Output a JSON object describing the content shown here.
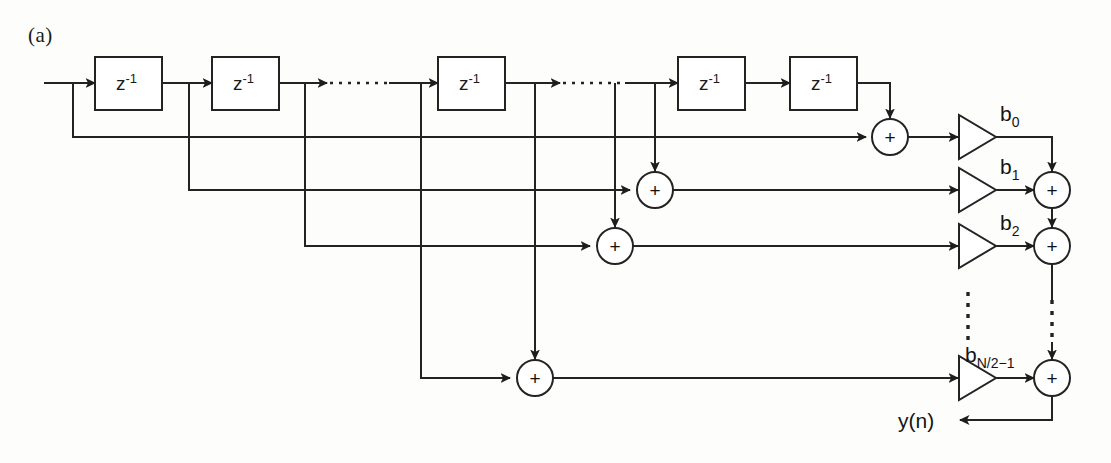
{
  "figure": {
    "panel_label": "(a)",
    "type": "signal-flow-diagram"
  },
  "delays": {
    "label": "z",
    "exponent": "-1",
    "count_shown": 5,
    "items": [
      {
        "id": "z1",
        "label": "z",
        "exponent": "-1"
      },
      {
        "id": "z2",
        "label": "z",
        "exponent": "-1"
      },
      {
        "id": "z3",
        "label": "z",
        "exponent": "-1"
      },
      {
        "id": "z4",
        "label": "z",
        "exponent": "-1"
      },
      {
        "id": "z5",
        "label": "z",
        "exponent": "-1"
      }
    ]
  },
  "adders": {
    "symbol": "+",
    "tap_adders": [
      {
        "id": "tap-adder-0"
      },
      {
        "id": "tap-adder-1"
      },
      {
        "id": "tap-adder-2"
      },
      {
        "id": "tap-adder-last"
      }
    ],
    "sum_adders": [
      {
        "id": "sum-adder-1"
      },
      {
        "id": "sum-adder-2"
      },
      {
        "id": "sum-adder-last"
      }
    ]
  },
  "coefficients": [
    {
      "id": "b0",
      "base": "b",
      "subscript": "0"
    },
    {
      "id": "b1",
      "base": "b",
      "subscript": "1"
    },
    {
      "id": "b2",
      "base": "b",
      "subscript": "2"
    },
    {
      "id": "bN",
      "base": "b",
      "subscript": "N/2−1"
    }
  ],
  "output": {
    "label": "y(n)"
  },
  "colors": {
    "line": "#232323",
    "text": "#141414",
    "background": "#fdfdfc",
    "fill": "#ffffff"
  },
  "ellipsis": {
    "horizontal_count": 2,
    "vertical_count": 2,
    "style": "dotted"
  }
}
